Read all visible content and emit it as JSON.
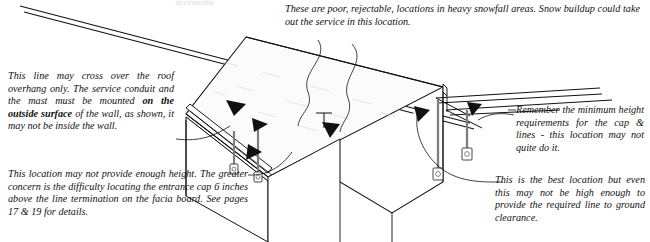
{
  "figure": {
    "type": "technical-line-illustration",
    "background_color": "#ffffff",
    "ink_color": "#111111",
    "roof_fill_color": "#fbfbfb",
    "wall_fill_color": "#ffffff"
  },
  "notes": {
    "cross_roof": {
      "line1": "This line may cross over the roof overhang only.  The service conduit and the mast must be mounted ",
      "bold": "on the outside  surface",
      "line2": " of the wall, as shown, it may not be inside the wall."
    },
    "not_enough_height": "This location may not provide enough height.  The greater concern is the difficulty locating the entrance cap 6 inches above the line termination on the facia board.   See pages 17 & 19 for details.",
    "snowfall": "These are poor, rejectable, locations in heavy snowfall areas.  Snow buildup could take out the service in this location.",
    "minimum_height": "Remember the minimum height requirements for the cap & lines - this location may not quite do it.",
    "best_location": "This is the best location but even this may not be high enough to provide the required line to ground clearance.",
    "top_faint": "acceptable"
  },
  "callouts": {
    "eave_mast_left": "arrow-pointing-to-eave-mast-left",
    "eave_mast_right": "arrow-pointing-to-eave-mast-right",
    "roof_overhang": "arrow-pointing-to-roof-overhang",
    "facia_board": "arrow-pointing-to-facia-board",
    "gable_mast_left": "arrow-pointing-to-gable-mast-left",
    "gable_mast_right": "arrow-pointing-to-gable-mast-right"
  },
  "parts": {
    "service_drop_lines": "service-drop-lines",
    "roof_plane": "roof-plane",
    "gable_end_wall": "gable-end-wall",
    "front_wall": "front-wall",
    "eave_facia": "eave-facia-board",
    "mast_eave_1": "service-mast-eave-1",
    "mast_eave_2": "service-mast-eave-2",
    "mast_gable_1": "service-mast-gable-1",
    "mast_gable_2": "service-mast-gable-2",
    "meter_eave_1": "meter-socket-eave-1",
    "meter_eave_2": "meter-socket-eave-2",
    "meter_gable_1": "meter-socket-gable-1",
    "meter_gable_2": "meter-socket-gable-2"
  }
}
